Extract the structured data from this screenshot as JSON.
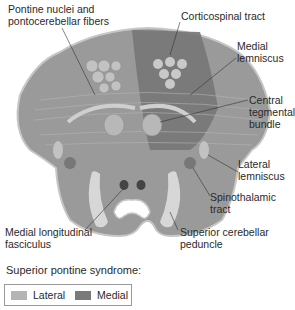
{
  "diagram": {
    "labels": {
      "pontine_nuclei": "Pontine nuclei and\npontocerebellar fibers",
      "corticospinal": "Corticospinal tract",
      "medial_lemniscus": "Medial\nlemniscus",
      "central_tegmental": "Central\ntegmental\nbundle",
      "lateral_lemniscus": "Lateral\nlemniscus",
      "spinothalamic": "Spinothalamic tract",
      "mlf": "Medial longitudinal\nfasciculus",
      "scp": "Superior cerebellar\npeduncle"
    },
    "colors": {
      "lateral_region": "#9c9c9c",
      "medial_region": "#777777",
      "structure_light": "#cfcfcf",
      "structure_dark": "#555555",
      "outline": "#bdbdbd"
    }
  },
  "legend": {
    "title": "Superior pontine syndrome:",
    "items": [
      {
        "label": "Lateral",
        "color": "#b4b4b4"
      },
      {
        "label": "Medial",
        "color": "#7a7a7a"
      }
    ]
  }
}
